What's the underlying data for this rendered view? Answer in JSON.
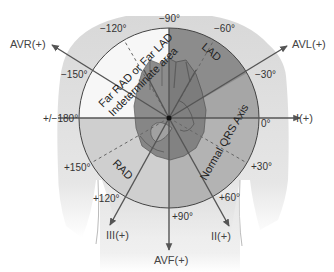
{
  "diagram": {
    "center": {
      "x": 169,
      "y": 118
    },
    "radius": 90,
    "colors": {
      "far_area": "#f7f7f7",
      "lad": "#8c8c8c",
      "normal": "#b5b5b5",
      "rad": "#cfcfcf",
      "torso": "#dedede",
      "lines": "#555555",
      "text": "#333333"
    },
    "regions": [
      {
        "id": "far",
        "label_line1": "Far RAD or Far LAD",
        "label_line2": "Indeterminate area"
      },
      {
        "id": "lad",
        "label": "LAD"
      },
      {
        "id": "normal",
        "label": "Normal QRS Axis"
      },
      {
        "id": "rad",
        "label": "RAD"
      }
    ],
    "degree_labels": {
      "m90": "−90°",
      "m60": "−60°",
      "m120": "−120°",
      "m30": "−30°",
      "m150": "−150°",
      "p0": "0°",
      "p180": "+/−180°",
      "p30": "+30°",
      "p150": "+150°",
      "p60": "+60°",
      "p120": "+120°",
      "p90": "+90°"
    },
    "leads": {
      "avr": "AVR(+)",
      "avl": "AVL(+)",
      "i": "I(+)",
      "ii": "II(+)",
      "iii": "III(+)",
      "avf": "AVF(+)"
    }
  }
}
